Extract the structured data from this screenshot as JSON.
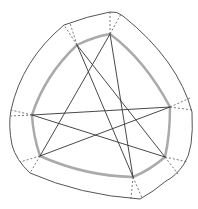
{
  "diagram": {
    "width": 198,
    "height": 209,
    "colors": {
      "outer_boundary": "#555555",
      "inner_curve": "#aaaaaa",
      "chords": "#333333",
      "dashed": "#555555",
      "background": "#ffffff"
    },
    "vertices": [
      {
        "id": "top-left",
        "x": 77,
        "y": 45
      },
      {
        "id": "top",
        "x": 110,
        "y": 34
      },
      {
        "id": "right",
        "x": 170,
        "y": 107
      },
      {
        "id": "bottom-right",
        "x": 165,
        "y": 157
      },
      {
        "id": "bottom",
        "x": 133,
        "y": 177
      },
      {
        "id": "bottom-left",
        "x": 40,
        "y": 156
      },
      {
        "id": "left",
        "x": 32,
        "y": 115
      }
    ],
    "chords": [
      [
        "left",
        "right"
      ],
      [
        "left",
        "bottom-right"
      ],
      [
        "bottom-left",
        "right"
      ],
      [
        "bottom-left",
        "top"
      ],
      [
        "top-left",
        "bottom"
      ],
      [
        "top-left",
        "bottom-right"
      ],
      [
        "top",
        "bottom"
      ]
    ],
    "dashed_fans": [
      {
        "from": "top-left",
        "to": [
          [
            64,
            25
          ],
          [
            70,
            23
          ]
        ]
      },
      {
        "from": "top",
        "to": [
          [
            110,
            12
          ],
          [
            121,
            14
          ]
        ]
      },
      {
        "from": "right",
        "to": [
          [
            190,
            98
          ],
          [
            192,
            110
          ]
        ]
      },
      {
        "from": "bottom-right",
        "to": [
          [
            188,
            162
          ],
          [
            178,
            174
          ]
        ]
      },
      {
        "from": "bottom",
        "to": [
          [
            131,
            199
          ],
          [
            142,
            198
          ]
        ]
      },
      {
        "from": "bottom-left",
        "to": [
          [
            20,
            162
          ],
          [
            30,
            173
          ]
        ]
      },
      {
        "from": "left",
        "to": [
          [
            11,
            110
          ],
          [
            11,
            116
          ]
        ]
      }
    ]
  }
}
